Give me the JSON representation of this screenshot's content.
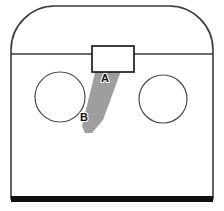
{
  "figure": {
    "title": "Bagged cabinet front with diagonal strap",
    "width": 224,
    "height": 211,
    "background": "#ffffff"
  },
  "labels": {
    "marker_a": "A",
    "marker_b": "B"
  },
  "colors": {
    "outline_stroke": "#3a3a3a",
    "latch_stroke": "#1e1e1e",
    "circle_stroke": "#4a4a4a",
    "band_fill": "#9e9e9e",
    "base_bar": "#111111",
    "page_background": "#ffffff"
  },
  "geometry": {
    "body": {
      "name": "rounded-top-enclosure",
      "left": 11,
      "right": 213,
      "top": 6,
      "bottom": 199,
      "corner_radius": 44
    },
    "divider": {
      "name": "horizontal-seam",
      "y": 54,
      "x1": 11,
      "x2": 213
    },
    "latch": {
      "name": "top-latch-rectangle",
      "x": 92,
      "y": 46,
      "width": 42,
      "height": 26
    },
    "circle_left": {
      "name": "left-port",
      "cx": 60,
      "cy": 97,
      "r": 25
    },
    "circle_right": {
      "name": "right-port",
      "cx": 163,
      "cy": 99,
      "r": 24
    },
    "band": {
      "name": "diagonal-strap",
      "points": "100,52 128,52 103,120 92,133 85,133 82,126"
    },
    "base_bar": {
      "name": "bottom-base-bar",
      "x": 11,
      "y": 196,
      "width": 202,
      "height": 6
    },
    "marker_a_pos": {
      "x": 105,
      "y": 82
    },
    "marker_b_pos": {
      "x": 84,
      "y": 121
    }
  },
  "chart_data": {
    "type": "diagram",
    "annotations": [
      {
        "label": "A",
        "x": 105,
        "y": 82,
        "describes": "upper segment of diagonal band"
      },
      {
        "label": "B",
        "x": 84,
        "y": 121,
        "describes": "lower tip of diagonal band near left port"
      }
    ],
    "elements": [
      "rounded-top-enclosure",
      "horizontal-seam",
      "top-latch-rectangle",
      "left-port",
      "right-port",
      "diagonal-strap",
      "bottom-base-bar"
    ]
  }
}
